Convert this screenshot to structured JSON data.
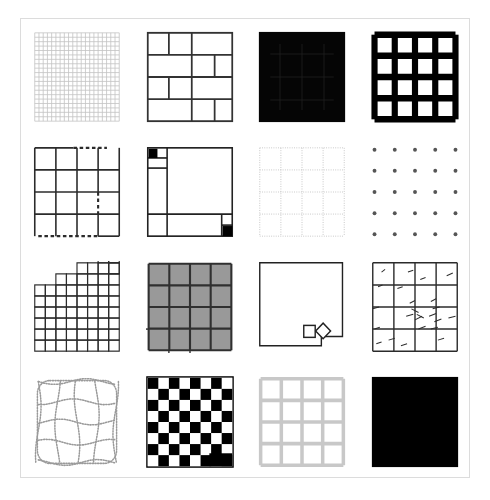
{
  "page": {
    "background_color": "#ffffff",
    "frame_color": "#dcdcdc",
    "frame_width_px": 450,
    "frame_height_px": 460,
    "layout": "4 rows x 4 columns of grid-pattern thumbnails",
    "tile_count": 16
  },
  "palette": {
    "black": "#000000",
    "near_black": "#0a0a0a",
    "dark_gray": "#333333",
    "mid_gray": "#8c8c8c",
    "light_gray": "#c8c8c8",
    "pale_gray": "#d8d8d8",
    "fill_gray": "#999999",
    "white": "#ffffff"
  },
  "tiles": [
    {
      "index": 1,
      "position": "row 1, column 1",
      "name": "fine-mesh-grid",
      "label": "Fine mesh grid",
      "description": "Dense 20x20 light gray mesh of thin lines filling a square.",
      "rows": 20,
      "columns": 20,
      "line_color": "#c0c0c0",
      "line_width": 0.9,
      "fill": "none",
      "border_style": "solid"
    },
    {
      "index": 2,
      "position": "row 1, column 2",
      "name": "brick-offset-grid",
      "label": "Brick offset grid",
      "description": "Four horizontal bands with staggered vertical dividers, brick-like layout.",
      "rows": 4,
      "columns": 3,
      "line_color": "#333333",
      "line_width": 2.0,
      "fill": "none",
      "border_style": "solid"
    },
    {
      "index": 3,
      "position": "row 1, column 3",
      "name": "inverted-black-grid",
      "label": "Inverted black grid",
      "description": "Solid black square with faint darker grid lines barely visible.",
      "rows": 4,
      "columns": 4,
      "line_color": "#1c1c1c",
      "line_width": 1.0,
      "fill": "#050505",
      "border_style": "solid"
    },
    {
      "index": 4,
      "position": "row 1, column 4",
      "name": "bold-black-grid",
      "label": "Bold black grid",
      "description": "Heavy black 4x4 lattice with white cell interiors.",
      "rows": 4,
      "columns": 4,
      "line_color": "#000000",
      "line_width": 7.0,
      "fill": "none",
      "border_style": "solid"
    },
    {
      "index": 5,
      "position": "row 2, column 1",
      "name": "dashed-segment-grid",
      "label": "Dashed segment grid",
      "description": "4x4 grid where parts of the top edge, bottom edge and one interior vertical are dashed.",
      "rows": 4,
      "columns": 4,
      "line_color": "#2b2b2b",
      "line_width": 1.8,
      "fill": "none",
      "border_style": "mixed solid and dashed"
    },
    {
      "index": 6,
      "position": "row 2, column 2",
      "name": "asymmetric-partition",
      "label": "Asymmetric partition",
      "description": "Irregular partition with a narrow left column, a wide open panel, and black filled squares at top-left and bottom-right.",
      "rows": 3,
      "columns": 2,
      "line_color": "#222222",
      "line_width": 1.8,
      "fill": "none",
      "accent_fill": "#000000",
      "border_style": "solid"
    },
    {
      "index": 7,
      "position": "row 2, column 3",
      "name": "faint-dotted-grid",
      "label": "Faint dotted grid",
      "description": "Pale 4x4 grid drawn with fine dotted strokes.",
      "rows": 4,
      "columns": 4,
      "line_color": "#bdbdbd",
      "line_width": 1.0,
      "fill": "none",
      "border_style": "dotted"
    },
    {
      "index": 8,
      "position": "row 2, column 4",
      "name": "dot-lattice",
      "label": "Dot lattice",
      "description": "Only the grid intersections are drawn, forming a 5x5 array of small dark dots.",
      "rows": 5,
      "columns": 5,
      "line_color": "#555555",
      "line_width": 0,
      "dot_size": 2.2,
      "fill": "none",
      "border_style": "none"
    },
    {
      "index": 9,
      "position": "row 3, column 1",
      "name": "staircase-grid",
      "label": "Staircase grid",
      "description": "Dense 8x8 grid with a stepped top-right edge and a few detached cells floating above the stairs.",
      "rows": 8,
      "columns": 8,
      "line_color": "#2b2b2b",
      "line_width": 1.3,
      "fill": "none",
      "border_style": "solid"
    },
    {
      "index": 10,
      "position": "row 3, column 2",
      "name": "gray-filled-grid",
      "label": "Gray filled grid",
      "description": "4x4 grid with mid-gray cell fills, dark separators and short lines protruding from the left and bottom edges.",
      "rows": 4,
      "columns": 4,
      "line_color": "#303030",
      "line_width": 2.4,
      "fill": "#999999",
      "border_style": "solid"
    },
    {
      "index": 11,
      "position": "row 3, column 3",
      "name": "empty-square-with-markers",
      "label": "Empty square with markers",
      "description": "An empty outlined square with a small square marker and a diamond marker overlapping the lower-right edge.",
      "rows": 1,
      "columns": 1,
      "line_color": "#222222",
      "line_width": 1.6,
      "fill": "none",
      "border_style": "solid"
    },
    {
      "index": 12,
      "position": "row 3, column 4",
      "name": "sketchy-noisy-grid",
      "label": "Sketchy noisy grid",
      "description": "4x4 grid overdrawn with short hand-drawn scribble strokes clustered near the centre and edges.",
      "rows": 4,
      "columns": 4,
      "line_color": "#2b2b2b",
      "line_width": 1.6,
      "fill": "none",
      "border_style": "solid with noise"
    },
    {
      "index": 13,
      "position": "row 4, column 1",
      "name": "warped-dotted-grid",
      "label": "Warped dotted grid",
      "description": "A 4x4 grid with wavy, bowed lines and rounded outer corners, drawn in gray dots.",
      "rows": 4,
      "columns": 4,
      "line_color": "#9a9a9a",
      "line_width": 1.6,
      "fill": "none",
      "border_style": "dotted wavy"
    },
    {
      "index": 14,
      "position": "row 4, column 2",
      "name": "checkerboard",
      "label": "Checkerboard",
      "description": "8x8 black and white checkerboard with a solid black rectangle covering two cells at the bottom-right.",
      "rows": 8,
      "columns": 8,
      "line_color": "#000000",
      "line_width": 0,
      "fill": "#000000",
      "border_style": "none"
    },
    {
      "index": 15,
      "position": "row 4, column 3",
      "name": "light-gray-grid",
      "label": "Light gray grid",
      "description": "4x4 grid of medium-thick pale gray bars with white cells.",
      "rows": 4,
      "columns": 4,
      "line_color": "#c8c8c8",
      "line_width": 4.0,
      "fill": "none",
      "border_style": "solid"
    },
    {
      "index": 16,
      "position": "row 4, column 4",
      "name": "solid-black-square",
      "label": "Solid black square",
      "description": "Completely filled black square with no visible grid structure.",
      "rows": 1,
      "columns": 1,
      "line_color": "#000000",
      "line_width": 0,
      "fill": "#000000",
      "border_style": "none"
    }
  ]
}
